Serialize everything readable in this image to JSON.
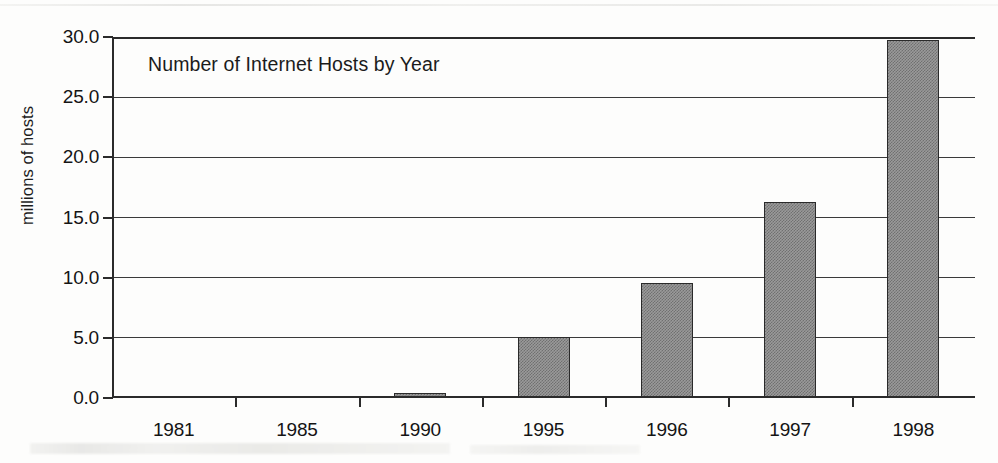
{
  "chart_data": {
    "type": "bar",
    "title": "Number of Internet Hosts by Year",
    "xlabel": "",
    "ylabel": "millions of hosts",
    "categories": [
      "1981",
      "1985",
      "1990",
      "1995",
      "1996",
      "1997",
      "1998"
    ],
    "values": [
      0.0,
      0.0,
      0.3,
      5.0,
      9.5,
      16.2,
      29.7
    ],
    "ylim": [
      0.0,
      30.0
    ],
    "ytick_labels": [
      "0.0",
      "5.0",
      "10.0",
      "15.0",
      "20.0",
      "25.0",
      "30.0"
    ],
    "ytick_values": [
      0.0,
      5.0,
      10.0,
      15.0,
      20.0,
      25.0,
      30.0
    ],
    "grid": true,
    "legend": false,
    "bar_color": "#9a9a9a",
    "bar_edge_color": "#2a2a2a",
    "axis_color": "#2b2b2b",
    "title_position": "inside-top-left"
  }
}
